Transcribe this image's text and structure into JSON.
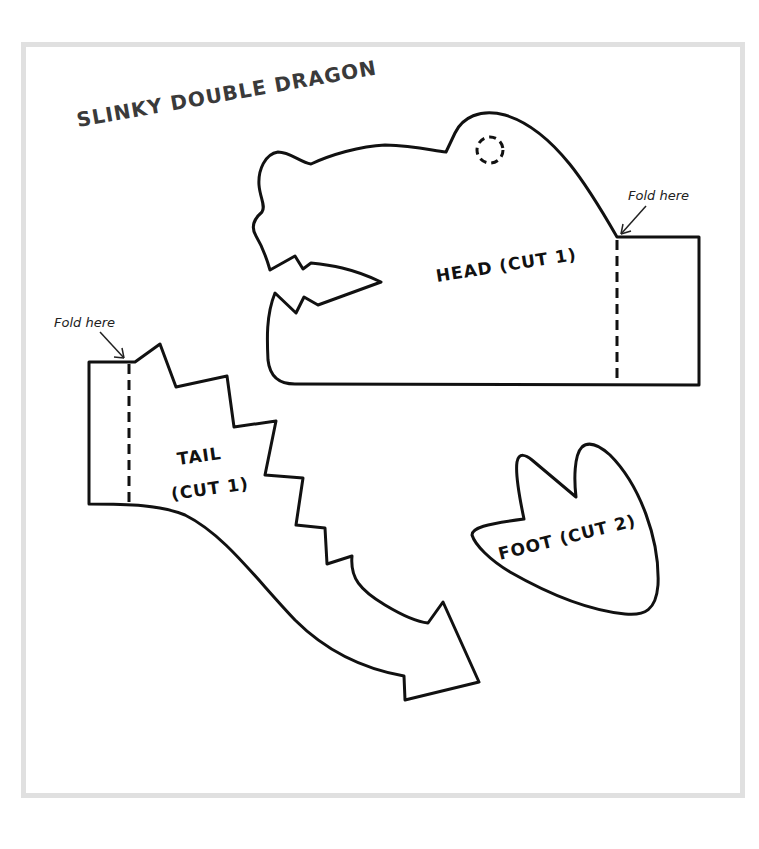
{
  "page": {
    "title": "SLINKY DOUBLE DRAGON",
    "frame_border_color": "#e0e0e0",
    "line_color": "#111111"
  },
  "pieces": {
    "head": {
      "label": "HEAD (CUT 1)",
      "fold_label": "Fold here",
      "has_eye_hole": true
    },
    "tail": {
      "label_line1": "TAIL",
      "label_line2": "(CUT 1)",
      "fold_label": "Fold here"
    },
    "foot": {
      "label": "FOOT (CUT 2)"
    }
  }
}
